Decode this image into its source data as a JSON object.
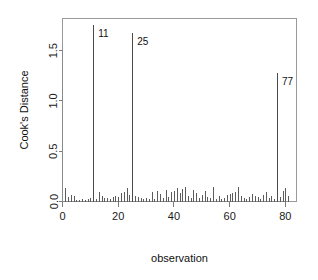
{
  "chart_data": {
    "type": "bar",
    "title": "",
    "subtitle": "",
    "xlabel": "observation",
    "ylabel": "Cook's Distance",
    "xlim": [
      0,
      84
    ],
    "ylim": [
      0,
      1.82
    ],
    "grid": false,
    "legend": null,
    "xticks": [
      0,
      20,
      40,
      60,
      80
    ],
    "xticklabels": [
      "0",
      "20",
      "40",
      "60",
      "80"
    ],
    "yticks": [
      0.0,
      0.5,
      1.0,
      1.5
    ],
    "yticklabels": [
      "0.0",
      "0.5",
      "1.0",
      "1.5"
    ],
    "annotations": [
      {
        "label": "11",
        "x": 11,
        "y": 1.76
      },
      {
        "label": "25",
        "x": 25,
        "y": 1.68
      },
      {
        "label": "77",
        "x": 77,
        "y": 1.28
      }
    ],
    "x": [
      1,
      2,
      3,
      4,
      5,
      6,
      7,
      8,
      9,
      10,
      11,
      12,
      13,
      14,
      15,
      16,
      17,
      18,
      19,
      20,
      21,
      22,
      23,
      24,
      25,
      26,
      27,
      28,
      29,
      30,
      31,
      32,
      33,
      34,
      35,
      36,
      37,
      38,
      39,
      40,
      41,
      42,
      43,
      44,
      45,
      46,
      47,
      48,
      49,
      50,
      51,
      52,
      53,
      54,
      55,
      56,
      57,
      58,
      59,
      60,
      61,
      62,
      63,
      64,
      65,
      66,
      67,
      68,
      69,
      70,
      71,
      72,
      73,
      74,
      75,
      76,
      77,
      78,
      79,
      80,
      81
    ],
    "values": [
      0.13,
      0.04,
      0.06,
      0.05,
      0.01,
      0.01,
      0.02,
      0.01,
      0.02,
      0.03,
      1.76,
      0.02,
      0.09,
      0.05,
      0.03,
      0.03,
      0.02,
      0.04,
      0.05,
      0.04,
      0.08,
      0.09,
      0.13,
      0.06,
      1.68,
      0.05,
      0.04,
      0.03,
      0.02,
      0.03,
      0.02,
      0.09,
      0.02,
      0.1,
      0.07,
      0.03,
      0.11,
      0.04,
      0.09,
      0.1,
      0.13,
      0.08,
      0.12,
      0.14,
      0.05,
      0.03,
      0.11,
      0.08,
      0.03,
      0.06,
      0.1,
      0.04,
      0.03,
      0.14,
      0.02,
      0.05,
      0.02,
      0.03,
      0.06,
      0.07,
      0.08,
      0.09,
      0.14,
      0.05,
      0.03,
      0.02,
      0.04,
      0.07,
      0.05,
      0.04,
      0.02,
      0.06,
      0.09,
      0.03,
      0.05,
      0.02,
      1.28,
      0.04,
      0.1,
      0.13,
      0.05
    ]
  }
}
